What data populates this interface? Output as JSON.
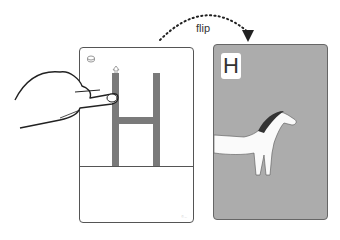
{
  "diagram": {
    "action_label": "flip",
    "left_card": {
      "type": "tracing card",
      "letter": "H",
      "letter_color": "#7a7a7a",
      "footer_text": "© ..."
    },
    "right_card": {
      "type": "picture card",
      "letter": "H",
      "image": "horse-icon",
      "background_color": "#acacac"
    },
    "arrow": {
      "style": "dotted-arc",
      "direction": "left-to-right"
    }
  }
}
